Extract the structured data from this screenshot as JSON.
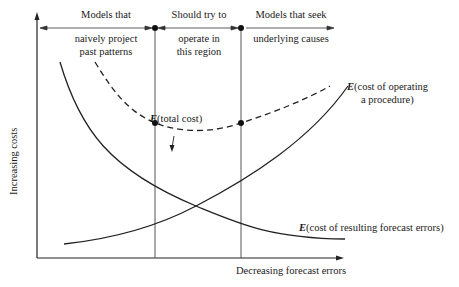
{
  "diagram": {
    "regions": [
      {
        "line1": "Models that",
        "line2": "naively project",
        "line3": "past patterns"
      },
      {
        "line1": "Should try to",
        "line2": "operate in",
        "line3": "this region"
      },
      {
        "line1": "Models that seek",
        "line2": "underlying causes"
      }
    ],
    "curves": {
      "total_cost": {
        "prefix": "E",
        "text": "(total cost)"
      },
      "operating_cost": {
        "prefix": "E",
        "line1": "(cost of operating",
        "line2": "a procedure)"
      },
      "forecast_errors": {
        "prefix": "E",
        "text": "(cost of resulting forecast errors)"
      }
    },
    "axes": {
      "y_label": "Increasing costs",
      "x_label": "Decreasing forecast errors"
    }
  }
}
